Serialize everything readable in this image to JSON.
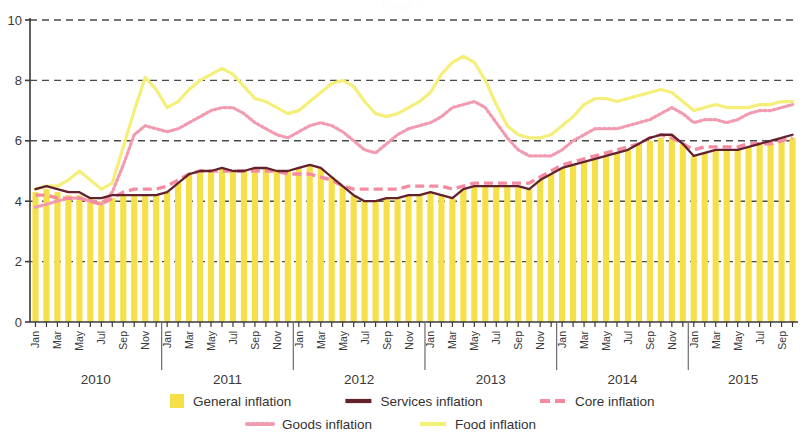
{
  "figure": {
    "background_color": "#ffffff",
    "ghost_title": "Graph 1"
  },
  "legend": {
    "position": "bottom",
    "items": [
      {
        "label": "General inflation",
        "marker": "bar",
        "color": "#f5e04a"
      },
      {
        "label": "Services inflation",
        "marker": "solid-line",
        "color": "#63212e"
      },
      {
        "label": "Core inflation",
        "marker": "dashed-line",
        "color": "#f48ba0"
      },
      {
        "label": "Goods inflation",
        "marker": "dotted-line",
        "color": "#f29ab0"
      },
      {
        "label": "Food inflation",
        "marker": "solid-line",
        "color": "#f5ef7a"
      }
    ]
  },
  "axes": {
    "y": {
      "min": 0,
      "max": 10,
      "ticks": [
        0,
        2,
        4,
        6,
        8,
        10
      ],
      "tick_labels": [
        "0",
        "2",
        "4",
        "6",
        "8",
        "10"
      ],
      "grid": true,
      "gridline_style": "dashed",
      "gridline_color": "#4a4a4a",
      "label": ""
    },
    "x": {
      "label": "",
      "month_tick_labels": [
        "Jan",
        "Mar",
        "May",
        "Jul",
        "Sep",
        "Nov"
      ],
      "year_labels": [
        "2010",
        "2011",
        "2012",
        "2013",
        "2014",
        "2015"
      ],
      "start": "Jan 2010",
      "end": "Oct 2015"
    }
  },
  "chart_data": {
    "type": "line",
    "title": "",
    "xlabel": "",
    "ylabel": "",
    "ylim": [
      0,
      10
    ],
    "grid": true,
    "legend_position": "bottom",
    "x": [
      "Jan 2010",
      "Feb 2010",
      "Mar 2010",
      "Apr 2010",
      "May 2010",
      "Jun 2010",
      "Jul 2010",
      "Aug 2010",
      "Sep 2010",
      "Oct 2010",
      "Nov 2010",
      "Dec 2010",
      "Jan 2011",
      "Feb 2011",
      "Mar 2011",
      "Apr 2011",
      "May 2011",
      "Jun 2011",
      "Jul 2011",
      "Aug 2011",
      "Sep 2011",
      "Oct 2011",
      "Nov 2011",
      "Dec 2011",
      "Jan 2012",
      "Feb 2012",
      "Mar 2012",
      "Apr 2012",
      "May 2012",
      "Jun 2012",
      "Jul 2012",
      "Aug 2012",
      "Sep 2012",
      "Oct 2012",
      "Nov 2012",
      "Dec 2012",
      "Jan 2013",
      "Feb 2013",
      "Mar 2013",
      "Apr 2013",
      "May 2013",
      "Jun 2013",
      "Jul 2013",
      "Aug 2013",
      "Sep 2013",
      "Oct 2013",
      "Nov 2013",
      "Dec 2013",
      "Jan 2014",
      "Feb 2014",
      "Mar 2014",
      "Apr 2014",
      "May 2014",
      "Jun 2014",
      "Jul 2014",
      "Aug 2014",
      "Sep 2014",
      "Oct 2014",
      "Nov 2014",
      "Dec 2014",
      "Jan 2015",
      "Feb 2015",
      "Mar 2015",
      "Apr 2015",
      "May 2015",
      "Jun 2015",
      "Jul 2015",
      "Aug 2015",
      "Sep 2015",
      "Oct 2015"
    ],
    "series": [
      {
        "name": "General inflation",
        "type": "bar",
        "color": "#f5e04a",
        "values": [
          4.3,
          4.4,
          4.3,
          4.2,
          4.2,
          4.1,
          4.0,
          4.1,
          4.2,
          4.2,
          4.2,
          4.2,
          4.3,
          4.6,
          4.9,
          5.0,
          5.0,
          5.1,
          5.0,
          5.0,
          5.1,
          5.1,
          5.0,
          5.0,
          5.1,
          5.2,
          5.1,
          4.8,
          4.5,
          4.2,
          4.0,
          4.0,
          4.1,
          4.1,
          4.2,
          4.2,
          4.3,
          4.2,
          4.1,
          4.4,
          4.5,
          4.5,
          4.5,
          4.5,
          4.5,
          4.4,
          4.7,
          4.9,
          5.1,
          5.2,
          5.3,
          5.4,
          5.5,
          5.6,
          5.7,
          5.9,
          6.0,
          6.1,
          6.2,
          5.9,
          5.5,
          5.6,
          5.7,
          5.7,
          5.7,
          5.8,
          5.9,
          5.9,
          6.0,
          6.1
        ]
      },
      {
        "name": "Services inflation",
        "type": "line",
        "color": "#63212e",
        "style": "solid",
        "values": [
          4.4,
          4.5,
          4.4,
          4.3,
          4.3,
          4.1,
          4.1,
          4.2,
          4.2,
          4.2,
          4.2,
          4.2,
          4.3,
          4.6,
          4.9,
          5.0,
          5.0,
          5.1,
          5.0,
          5.0,
          5.1,
          5.1,
          5.0,
          5.0,
          5.1,
          5.2,
          5.1,
          4.8,
          4.5,
          4.2,
          4.0,
          4.0,
          4.1,
          4.1,
          4.2,
          4.2,
          4.3,
          4.2,
          4.1,
          4.4,
          4.5,
          4.5,
          4.5,
          4.5,
          4.5,
          4.4,
          4.7,
          4.9,
          5.1,
          5.2,
          5.3,
          5.4,
          5.5,
          5.6,
          5.7,
          5.9,
          6.1,
          6.2,
          6.2,
          5.9,
          5.5,
          5.6,
          5.7,
          5.7,
          5.7,
          5.8,
          5.9,
          6.0,
          6.1,
          6.2
        ]
      },
      {
        "name": "Core inflation",
        "type": "line",
        "color": "#f48ba0",
        "style": "dashed",
        "values": [
          4.2,
          4.2,
          4.1,
          4.1,
          4.1,
          4.0,
          3.9,
          4.1,
          4.3,
          4.4,
          4.4,
          4.4,
          4.5,
          4.7,
          4.9,
          5.0,
          5.0,
          5.0,
          5.0,
          5.0,
          5.0,
          5.0,
          5.0,
          4.9,
          4.9,
          4.9,
          4.8,
          4.7,
          4.5,
          4.4,
          4.4,
          4.4,
          4.4,
          4.4,
          4.5,
          4.5,
          4.5,
          4.5,
          4.4,
          4.5,
          4.6,
          4.6,
          4.6,
          4.6,
          4.6,
          4.6,
          4.8,
          5.0,
          5.2,
          5.3,
          5.4,
          5.5,
          5.6,
          5.7,
          5.8,
          5.9,
          6.1,
          6.2,
          6.1,
          5.9,
          5.7,
          5.8,
          5.8,
          5.8,
          5.8,
          5.9,
          5.9,
          5.9,
          6.0,
          6.1
        ]
      },
      {
        "name": "Goods inflation",
        "type": "line",
        "color": "#f29ab0",
        "style": "dotted",
        "values": [
          3.8,
          3.9,
          4.0,
          4.1,
          4.1,
          4.0,
          3.9,
          4.3,
          5.2,
          6.2,
          6.5,
          6.4,
          6.3,
          6.4,
          6.6,
          6.8,
          7.0,
          7.1,
          7.1,
          6.9,
          6.6,
          6.4,
          6.2,
          6.1,
          6.3,
          6.5,
          6.6,
          6.5,
          6.3,
          6.0,
          5.7,
          5.6,
          5.9,
          6.2,
          6.4,
          6.5,
          6.6,
          6.8,
          7.1,
          7.2,
          7.3,
          7.1,
          6.6,
          6.1,
          5.7,
          5.5,
          5.5,
          5.5,
          5.7,
          6.0,
          6.2,
          6.4,
          6.4,
          6.4,
          6.5,
          6.6,
          6.7,
          6.9,
          7.1,
          6.9,
          6.6,
          6.7,
          6.7,
          6.6,
          6.7,
          6.9,
          7.0,
          7.0,
          7.1,
          7.2
        ]
      },
      {
        "name": "Food inflation",
        "type": "line",
        "color": "#f5ef7a",
        "style": "solid",
        "values": [
          4.4,
          4.5,
          4.5,
          4.7,
          5.0,
          4.7,
          4.4,
          4.6,
          5.8,
          7.0,
          8.1,
          7.7,
          7.1,
          7.3,
          7.7,
          8.0,
          8.2,
          8.4,
          8.2,
          7.8,
          7.4,
          7.3,
          7.1,
          6.9,
          7.0,
          7.3,
          7.6,
          7.9,
          8.0,
          7.8,
          7.3,
          6.9,
          6.8,
          6.9,
          7.1,
          7.3,
          7.6,
          8.2,
          8.6,
          8.8,
          8.6,
          8.0,
          7.2,
          6.5,
          6.2,
          6.1,
          6.1,
          6.2,
          6.5,
          6.8,
          7.2,
          7.4,
          7.4,
          7.3,
          7.4,
          7.5,
          7.6,
          7.7,
          7.6,
          7.3,
          7.0,
          7.1,
          7.2,
          7.1,
          7.1,
          7.1,
          7.2,
          7.2,
          7.3,
          7.3
        ]
      }
    ]
  }
}
